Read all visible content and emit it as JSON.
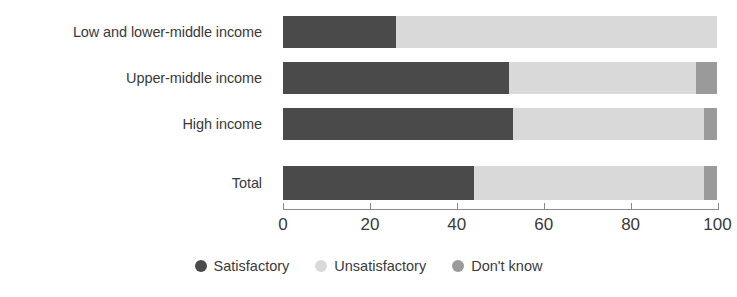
{
  "chart_data": {
    "type": "bar",
    "orientation": "horizontal",
    "stacked": true,
    "title": "",
    "subtitle": "",
    "xlabel": "",
    "ylabel": "",
    "xlim": [
      0,
      103
    ],
    "xticks": [
      0,
      20,
      40,
      60,
      80,
      100
    ],
    "xtick_labels": [
      "0",
      "20",
      "40",
      "60",
      "80",
      "100"
    ],
    "grid": false,
    "legend_position": "bottom-center",
    "categories": [
      "Low and lower-middle income",
      "Upper-middle income",
      "High income",
      "Total"
    ],
    "series": [
      {
        "name": "Satisfactory",
        "color": "#4a4a4a",
        "values": [
          26,
          52,
          53,
          44
        ]
      },
      {
        "name": "Unsatisfactory",
        "color": "#d9d9d9",
        "values": [
          74,
          43,
          44,
          53
        ]
      },
      {
        "name": "Don't know",
        "color": "#9a9a9a",
        "values": [
          0,
          5,
          3,
          3
        ]
      }
    ]
  },
  "axis": {
    "tick_labels": [
      "0",
      "20",
      "40",
      "60",
      "80",
      "100"
    ]
  },
  "category_labels": [
    "Low and lower-middle income",
    "Upper-middle income",
    "High income",
    "Total"
  ],
  "legend": {
    "items": [
      {
        "label": "Satisfactory",
        "color": "#4a4a4a"
      },
      {
        "label": "Unsatisfactory",
        "color": "#d9d9d9"
      },
      {
        "label": "Don't know",
        "color": "#9a9a9a"
      }
    ]
  }
}
